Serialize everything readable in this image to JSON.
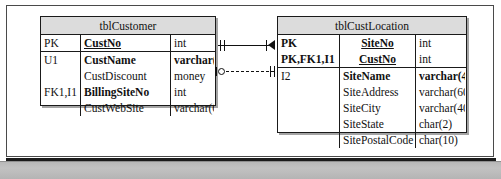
{
  "diagram": {
    "notation": "IDEF1X",
    "background_color": "#ffffff",
    "line_color": "#111111",
    "header_fill": "#dcdcdc",
    "bottom_band_color": "#bcbcbc"
  },
  "entities": [
    {
      "id": "tblCustomer",
      "name": "tblCustomer",
      "primary_key_attributes": [
        {
          "key": "PK",
          "name": "CustNo",
          "type": "int",
          "bold": true,
          "underline": true
        }
      ],
      "attributes": [
        {
          "key": "U1",
          "name": "CustName",
          "type": "varchar(40)",
          "bold": true
        },
        {
          "key": "",
          "name": "CustDiscount",
          "type": "money",
          "bold": false
        },
        {
          "key": "FK1,I1",
          "name": "BillingSiteNo",
          "type": "int",
          "bold": true
        },
        {
          "key": "",
          "name": "CustWebSite",
          "type": "varchar(60)",
          "bold": false
        }
      ]
    },
    {
      "id": "tblCustLocation",
      "name": "tblCustLocation",
      "primary_key_attributes": [
        {
          "key": "PK",
          "name": "SiteNo",
          "type": "int",
          "bold": true,
          "underline": true
        },
        {
          "key": "PK,FK1,I1",
          "name": "CustNo",
          "type": "int",
          "bold": true,
          "underline": true
        }
      ],
      "attributes": [
        {
          "key": "I2",
          "name": "SiteName",
          "type": "varchar(40)",
          "bold": true
        },
        {
          "key": "",
          "name": "SiteAddress",
          "type": "varchar(60)",
          "bold": false
        },
        {
          "key": "",
          "name": "SiteCity",
          "type": "varchar(40)",
          "bold": false
        },
        {
          "key": "",
          "name": "SiteState",
          "type": "char(2)",
          "bold": false
        },
        {
          "key": "",
          "name": "SitePostalCode",
          "type": "char(10)",
          "bold": false
        }
      ]
    }
  ],
  "relationships": [
    {
      "id": "rel-identifying",
      "from": "tblCustomer",
      "to": "tblCustLocation",
      "line_style": "solid",
      "type": "identifying",
      "from_cardinality": "one-mandatory",
      "to_cardinality": "many",
      "from_symbol": "double-tick",
      "to_symbol": "crows-foot"
    },
    {
      "id": "rel-non-identifying",
      "from": "tblCustomer",
      "to": "tblCustLocation",
      "line_style": "dashed",
      "type": "non-identifying",
      "from_cardinality": "zero-or-one-optional",
      "to_cardinality": "one-mandatory",
      "from_symbol": "circle",
      "to_symbol": "double-tick"
    }
  ]
}
